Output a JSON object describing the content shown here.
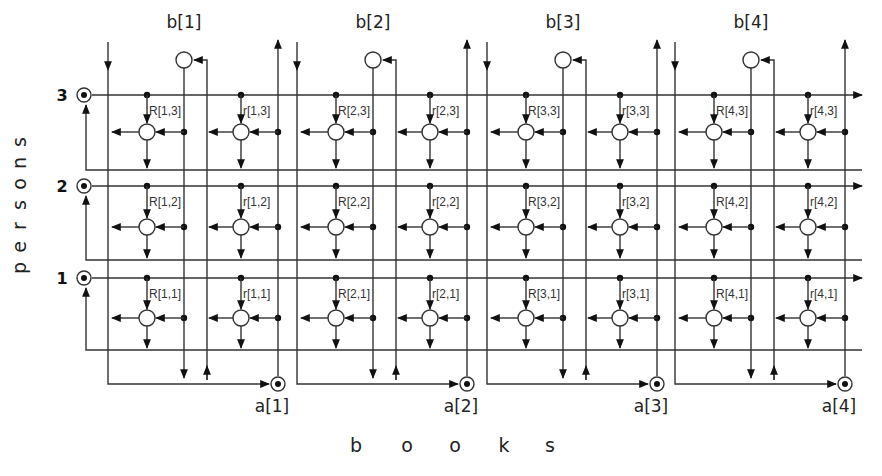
{
  "diagram": {
    "x_axis_label": "b o o k s",
    "y_axis_label": "p e r s o n s",
    "x_axis_letters": [
      "b",
      "o",
      "o",
      "k",
      "s"
    ],
    "y_axis_letters": [
      "p",
      "e",
      "r",
      "s",
      "o",
      "n",
      "s"
    ],
    "persons": [
      {
        "id": "3",
        "label": "3"
      },
      {
        "id": "2",
        "label": "2"
      },
      {
        "id": "1",
        "label": "1"
      }
    ],
    "books": [
      {
        "id": "1",
        "top_label": "b[1]",
        "bottom_label": "a[1]"
      },
      {
        "id": "2",
        "top_label": "b[2]",
        "bottom_label": "a[2]"
      },
      {
        "id": "3",
        "top_label": "b[3]",
        "bottom_label": "a[3]"
      },
      {
        "id": "4",
        "top_label": "b[4]",
        "bottom_label": "a[4]"
      }
    ],
    "cells": [
      {
        "book": 1,
        "person": 3,
        "R": "R[1,3]",
        "r": "r[1,3]"
      },
      {
        "book": 2,
        "person": 3,
        "R": "R[2,3]",
        "r": "r[2,3]"
      },
      {
        "book": 3,
        "person": 3,
        "R": "R[3,3]",
        "r": "r[3,3]"
      },
      {
        "book": 4,
        "person": 3,
        "R": "R[4,3]",
        "r": "r[4,3]"
      },
      {
        "book": 1,
        "person": 2,
        "R": "R[1,2]",
        "r": "r[1,2]"
      },
      {
        "book": 2,
        "person": 2,
        "R": "R[2,2]",
        "r": "r[2,2]"
      },
      {
        "book": 3,
        "person": 2,
        "R": "R[3,2]",
        "r": "r[3,2]"
      },
      {
        "book": 4,
        "person": 2,
        "R": "R[4,2]",
        "r": "r[4,2]"
      },
      {
        "book": 1,
        "person": 1,
        "R": "R[1,1]",
        "r": "r[1,1]"
      },
      {
        "book": 2,
        "person": 1,
        "R": "R[2,1]",
        "r": "r[2,1]"
      },
      {
        "book": 3,
        "person": 1,
        "R": "R[3,1]",
        "r": "r[3,1]"
      },
      {
        "book": 4,
        "person": 1,
        "R": "R[4,1]",
        "r": "r[4,1]"
      }
    ],
    "colors": {
      "line": "#333333",
      "text": "#222222",
      "background": "#ffffff"
    }
  }
}
